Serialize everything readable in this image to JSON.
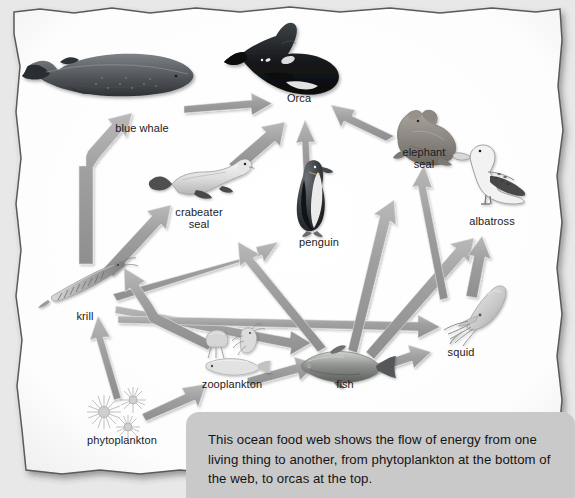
{
  "diagram": {
    "title": "Ocean Food Web",
    "background_color": "#e8e8e8",
    "paper_color": "#ffffff",
    "arrow_color": "#9a9a9a",
    "label_color": "#1b1b1b"
  },
  "organisms": [
    {
      "id": "blue-whale",
      "label": "blue whale",
      "label_x": 142,
      "label_y": 122,
      "art_x": 108,
      "art_y": 68,
      "trophic": "consumer"
    },
    {
      "id": "orca",
      "label": "Orca",
      "label_x": 299,
      "label_y": 92,
      "art_x": 282,
      "art_y": 58,
      "trophic": "apex-predator"
    },
    {
      "id": "elephant-seal",
      "label": "elephant\nseal",
      "label_x": 424,
      "label_y": 146,
      "art_x": 415,
      "art_y": 112,
      "trophic": "consumer"
    },
    {
      "id": "albatross",
      "label": "albatross",
      "label_x": 492,
      "label_y": 215,
      "art_x": 492,
      "art_y": 176,
      "trophic": "consumer"
    },
    {
      "id": "crabeater-seal",
      "label": "crabeater\nseal",
      "label_x": 199,
      "label_y": 206,
      "art_x": 199,
      "art_y": 172,
      "trophic": "consumer"
    },
    {
      "id": "penguin",
      "label": "penguin",
      "label_x": 319,
      "label_y": 236,
      "art_x": 314,
      "art_y": 190,
      "trophic": "consumer"
    },
    {
      "id": "squid",
      "label": "squid",
      "label_x": 461,
      "label_y": 346,
      "art_x": 470,
      "art_y": 310,
      "trophic": "consumer"
    },
    {
      "id": "krill",
      "label": "krill",
      "label_x": 85,
      "label_y": 310,
      "art_x": 84,
      "art_y": 280,
      "trophic": "primary-consumer"
    },
    {
      "id": "fish",
      "label": "fish",
      "label_x": 345,
      "label_y": 378,
      "art_x": 340,
      "art_y": 358,
      "trophic": "consumer"
    },
    {
      "id": "zooplankton",
      "label": "zooplankton",
      "label_x": 232,
      "label_y": 378,
      "art_x": 224,
      "art_y": 350,
      "trophic": "primary-consumer"
    },
    {
      "id": "phytoplankton",
      "label": "phytoplankton",
      "label_x": 122,
      "label_y": 434,
      "art_x": 122,
      "art_y": 404,
      "trophic": "producer"
    }
  ],
  "energy_flows": [
    {
      "from": "krill",
      "to": "blue-whale"
    },
    {
      "from": "blue-whale",
      "to": "orca"
    },
    {
      "from": "crabeater-seal",
      "to": "orca"
    },
    {
      "from": "elephant-seal",
      "to": "orca"
    },
    {
      "from": "penguin",
      "to": "orca"
    },
    {
      "from": "krill",
      "to": "crabeater-seal"
    },
    {
      "from": "krill",
      "to": "penguin"
    },
    {
      "from": "krill",
      "to": "fish"
    },
    {
      "from": "krill",
      "to": "squid"
    },
    {
      "from": "fish",
      "to": "penguin"
    },
    {
      "from": "fish",
      "to": "elephant-seal"
    },
    {
      "from": "fish",
      "to": "albatross"
    },
    {
      "from": "fish",
      "to": "squid"
    },
    {
      "from": "squid",
      "to": "elephant-seal"
    },
    {
      "from": "squid",
      "to": "albatross"
    },
    {
      "from": "zooplankton",
      "to": "krill"
    },
    {
      "from": "zooplankton",
      "to": "fish"
    },
    {
      "from": "phytoplankton",
      "to": "krill"
    },
    {
      "from": "phytoplankton",
      "to": "zooplankton"
    }
  ],
  "caption": {
    "text": "This ocean food web shows the flow of energy from one living thing to another, from phytoplankton at the bottom of the web, to orcas at the top.",
    "background_color": "#c9c9c9"
  }
}
